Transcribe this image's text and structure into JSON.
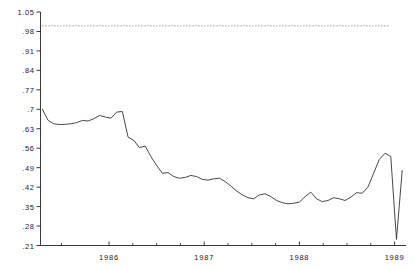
{
  "chart_data": {
    "type": "line",
    "title": "",
    "subtitle": "",
    "xlabel": "",
    "ylabel": "",
    "xlim": [
      1985.28,
      1989.12
    ],
    "ylim": [
      0.21,
      1.05
    ],
    "grid": false,
    "legend_position": "none",
    "y_ticks": [
      0.21,
      0.28,
      0.35,
      0.42,
      0.49,
      0.56,
      0.63,
      0.7,
      0.77,
      0.84,
      0.91,
      0.98,
      1.05
    ],
    "y_tick_labels": [
      ".21",
      ".28",
      ".35",
      ".42",
      ".49",
      ".56",
      ".63",
      ".7",
      ".77",
      ".84",
      ".91",
      ".98",
      "1.05"
    ],
    "x_ticks": [
      1986,
      1987,
      1988,
      1989
    ],
    "x_tick_labels": [
      "1986",
      "1987",
      "1988",
      "1989"
    ],
    "x_minor_ticks": [
      1985.5,
      1986.25,
      1986.5,
      1986.75,
      1987.25,
      1987.5,
      1987.75,
      1988.25,
      1988.5,
      1988.75
    ],
    "annotations": [
      {
        "name": "reference-line",
        "type": "horizontal-dotted-line",
        "value": 1.0,
        "x_start": 1985.3,
        "x_end": 1988.95,
        "color": "#555555"
      }
    ],
    "series": [
      {
        "name": "series-1",
        "color": "#333333",
        "x": [
          1985.3,
          1985.36,
          1985.42,
          1985.48,
          1985.54,
          1985.6,
          1985.66,
          1985.72,
          1985.78,
          1985.84,
          1985.9,
          1985.96,
          1986.02,
          1986.08,
          1986.14,
          1986.2,
          1986.26,
          1986.32,
          1986.38,
          1986.44,
          1986.5,
          1986.56,
          1986.62,
          1986.68,
          1986.74,
          1986.8,
          1986.86,
          1986.92,
          1986.98,
          1987.04,
          1987.1,
          1987.16,
          1987.22,
          1987.28,
          1987.34,
          1987.4,
          1987.46,
          1987.52,
          1987.58,
          1987.64,
          1987.7,
          1987.76,
          1987.82,
          1987.88,
          1987.94,
          1988.0,
          1988.06,
          1988.12,
          1988.18,
          1988.24,
          1988.3,
          1988.36,
          1988.42,
          1988.48,
          1988.54,
          1988.6,
          1988.66,
          1988.72,
          1988.78,
          1988.84,
          1988.9,
          1988.96,
          1989.02,
          1989.08
        ],
        "y": [
          0.7,
          0.66,
          0.648,
          0.645,
          0.646,
          0.648,
          0.652,
          0.66,
          0.658,
          0.666,
          0.678,
          0.672,
          0.668,
          0.69,
          0.692,
          0.6,
          0.588,
          0.562,
          0.568,
          0.53,
          0.498,
          0.47,
          0.472,
          0.458,
          0.452,
          0.455,
          0.462,
          0.458,
          0.448,
          0.445,
          0.45,
          0.452,
          0.44,
          0.424,
          0.406,
          0.392,
          0.382,
          0.378,
          0.392,
          0.396,
          0.386,
          0.372,
          0.364,
          0.36,
          0.362,
          0.366,
          0.386,
          0.402,
          0.378,
          0.368,
          0.372,
          0.382,
          0.378,
          0.372,
          0.384,
          0.4,
          0.398,
          0.42,
          0.47,
          0.52,
          0.542,
          0.53,
          0.232,
          0.48
        ]
      }
    ]
  }
}
